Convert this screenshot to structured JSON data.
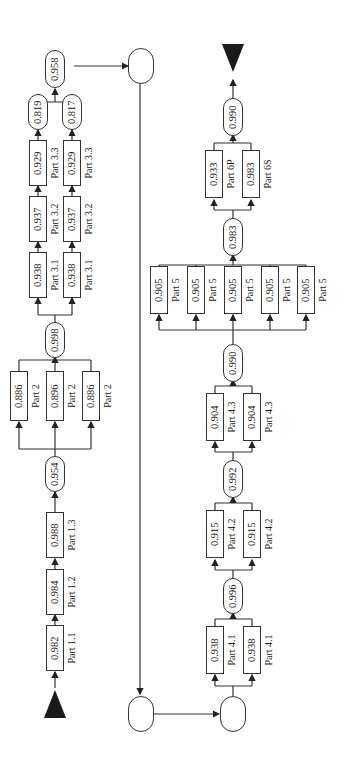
{
  "diagram": {
    "type": "reliability-block-diagram",
    "orientation": "rotated-90-ccw",
    "start_marker": "filled-triangle",
    "end_marker": "filled-triangle",
    "stage1": {
      "series": [
        {
          "part": "Part 1.1",
          "value": "0.982"
        },
        {
          "part": "Part 1.2",
          "value": "0.984"
        },
        {
          "part": "Part 1.3",
          "value": "0.988"
        }
      ],
      "after_series_value": "0.954"
    },
    "stage2": {
      "parallel": [
        {
          "part": "Part 2",
          "value": "0.886"
        },
        {
          "part": "Part 2",
          "value": "0.896"
        },
        {
          "part": "Part 2",
          "value": "0.886"
        }
      ],
      "combined_value": "0.998"
    },
    "stage3": {
      "branches": [
        {
          "series": [
            {
              "part": "Part 3.1",
              "value": "0.938"
            },
            {
              "part": "Part 3.2",
              "value": "0.937"
            },
            {
              "part": "Part 3.3",
              "value": "0.929"
            }
          ],
          "branch_value": "0.819"
        },
        {
          "series": [
            {
              "part": "Part 3.1",
              "value": "0.938"
            },
            {
              "part": "Part 3.2",
              "value": "0.937"
            },
            {
              "part": "Part 3.3",
              "value": "0.929"
            }
          ],
          "branch_value": "0.817"
        }
      ],
      "combined_value": "0.958"
    },
    "stage4_1": {
      "parallel": [
        {
          "part": "Part 4.1",
          "value": "0.938"
        },
        {
          "part": "Part 4.1",
          "value": "0.938"
        }
      ],
      "combined_value": "0.996"
    },
    "stage4_2": {
      "parallel": [
        {
          "part": "Part 4.2",
          "value": "0.915"
        },
        {
          "part": "Part 4.2",
          "value": "0.915"
        }
      ],
      "combined_value": "0.992"
    },
    "stage4_3": {
      "parallel": [
        {
          "part": "Part 4.3",
          "value": "0.904"
        },
        {
          "part": "Part 4.3",
          "value": "0.904"
        }
      ],
      "combined_value": "0.990"
    },
    "stage5": {
      "parallel": [
        {
          "part": "Part 5",
          "value": "0.905"
        },
        {
          "part": "Part 5",
          "value": "0.905"
        },
        {
          "part": "Part 5",
          "value": "0.905"
        },
        {
          "part": "Part 5",
          "value": "0.905"
        },
        {
          "part": "Part 5",
          "value": "0.905"
        }
      ],
      "combined_value": "0.983"
    },
    "stage6": {
      "parallel": [
        {
          "part": "Part 6P",
          "value": "0.933"
        },
        {
          "part": "Part 6S",
          "value": "0.983"
        }
      ],
      "combined_value": "0.990"
    }
  }
}
